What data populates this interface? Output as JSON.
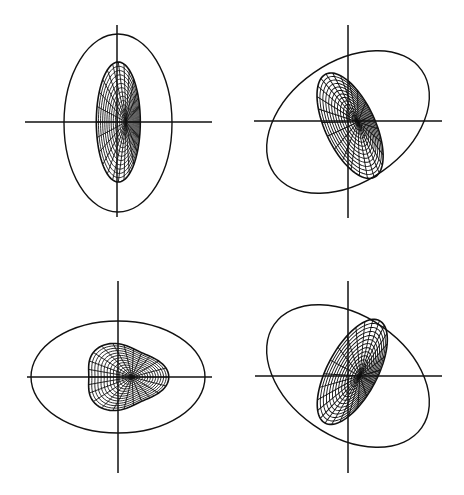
{
  "figure": {
    "layout": "2x2 grid",
    "colors": {
      "line": "#111111",
      "background": "#ffffff"
    },
    "panels": [
      {
        "id": "top-left",
        "axes": {
          "cx": 117,
          "cy": 122,
          "x1": 25,
          "x2": 212,
          "y1": 25,
          "y2": 217
        },
        "outer_ellipse": {
          "cx": 118,
          "cy": 123,
          "rx": 54,
          "ry": 89,
          "rotate": 0
        },
        "inner_shape": {
          "cx": 126,
          "cy": 122,
          "rx": 22,
          "ry": 60,
          "rotate": 0,
          "skew": "left-heavy",
          "rings": 14,
          "spokes": 24
        }
      },
      {
        "id": "top-right",
        "axes": {
          "cx": 348,
          "cy": 121,
          "x1": 254,
          "x2": 442,
          "y1": 25,
          "y2": 218
        },
        "outer_ellipse": {
          "cx": 348,
          "cy": 122,
          "rx": 90,
          "ry": 60,
          "rotate": 35
        },
        "inner_shape": {
          "cx": 358,
          "cy": 122,
          "rx": 25,
          "ry": 57,
          "rotate": -25,
          "rings": 14,
          "spokes": 24
        }
      },
      {
        "id": "bottom-left",
        "axes": {
          "cx": 118,
          "cy": 377,
          "x1": 27,
          "x2": 212,
          "y1": 281,
          "y2": 473
        },
        "outer_ellipse": {
          "cx": 118,
          "cy": 377,
          "rx": 87,
          "ry": 56,
          "rotate": 0
        },
        "inner_shape": {
          "cx": 132,
          "cy": 377,
          "rx": 40,
          "ry": 32,
          "rotate": 0,
          "shape": "rounded-triangle",
          "rings": 14,
          "spokes": 24
        }
      },
      {
        "id": "bottom-right",
        "axes": {
          "cx": 348,
          "cy": 376,
          "x1": 255,
          "x2": 442,
          "y1": 281,
          "y2": 473
        },
        "outer_ellipse": {
          "cx": 348,
          "cy": 376,
          "rx": 90,
          "ry": 60,
          "rotate": -35
        },
        "inner_shape": {
          "cx": 360,
          "cy": 376,
          "rx": 25,
          "ry": 58,
          "rotate": 28,
          "rings": 14,
          "spokes": 24
        }
      }
    ]
  }
}
